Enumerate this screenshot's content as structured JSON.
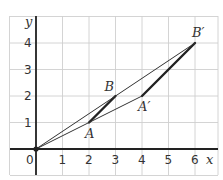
{
  "figure": {
    "type": "coordinate-grid enlargement",
    "x_axis_label": "x",
    "y_axis_label": "y",
    "x_range": [
      -1,
      6.9
    ],
    "y_range": [
      -1,
      5
    ],
    "x_ticks": [
      "0",
      "1",
      "2",
      "3",
      "4",
      "5",
      "6"
    ],
    "y_ticks": [
      "1",
      "2",
      "3",
      "4"
    ],
    "points": [
      {
        "id": "O",
        "label": "",
        "x": 0,
        "y": 0
      },
      {
        "id": "A",
        "label": "A",
        "x": 2,
        "y": 1,
        "label_pos": "below"
      },
      {
        "id": "B",
        "label": "B",
        "x": 3,
        "y": 2,
        "label_pos": "above-left"
      },
      {
        "id": "A2",
        "label": "A′",
        "x": 4,
        "y": 2,
        "label_pos": "below"
      },
      {
        "id": "B2",
        "label": "B′",
        "x": 6,
        "y": 4,
        "label_pos": "above-right"
      }
    ],
    "segments": [
      {
        "name": "segment-ab",
        "from": "A",
        "to": "B",
        "style": "thick"
      },
      {
        "name": "segment-a2b2",
        "from": "A2",
        "to": "B2",
        "style": "thick"
      },
      {
        "name": "ray-o-b2",
        "from": "O",
        "to": "B2",
        "style": "thin"
      },
      {
        "name": "ray-o-a2",
        "from": "O",
        "to": "A2",
        "style": "thin"
      }
    ],
    "colors": {
      "grid": "#cfcfcf",
      "ink": "#222222"
    }
  }
}
